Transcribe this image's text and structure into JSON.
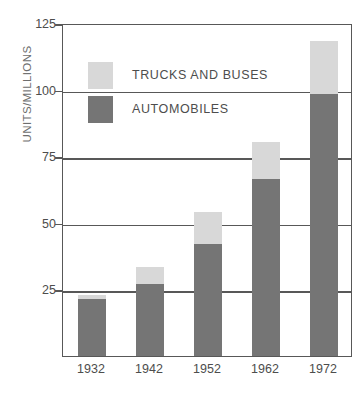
{
  "chart_data": {
    "type": "bar",
    "subtype": "stacked-bar",
    "title": "",
    "xlabel": "",
    "ylabel": "UNITS/MILLIONS",
    "categories": [
      "1932",
      "1942",
      "1952",
      "1962",
      "1972"
    ],
    "series": [
      {
        "name": "AUTOMOBILES",
        "color": "#757575",
        "values": [
          21.4,
          27.0,
          42.0,
          66.4,
          98.3
        ]
      },
      {
        "name": "TRUCKS AND BUSES",
        "color": "#d8d8d8",
        "values": [
          1.6,
          6.4,
          12.0,
          13.9,
          19.9
        ]
      }
    ],
    "totals": [
      23.0,
      33.4,
      54.0,
      80.3,
      118.2
    ],
    "ylim": [
      0,
      125
    ],
    "yticks": [
      25,
      50,
      75,
      100,
      125
    ],
    "ytick_labels": [
      "25",
      "50",
      "75",
      "100",
      "125"
    ],
    "grid": true,
    "legend_position": "upper-left-inside",
    "legend_entries": [
      "TRUCKS AND BUSES",
      "AUTOMOBILES"
    ]
  },
  "colors": {
    "automobiles": "#757575",
    "trucks_and_buses": "#d8d8d8",
    "axis": "#585858",
    "text": "#4d4d4d",
    "background": "#ffffff"
  }
}
